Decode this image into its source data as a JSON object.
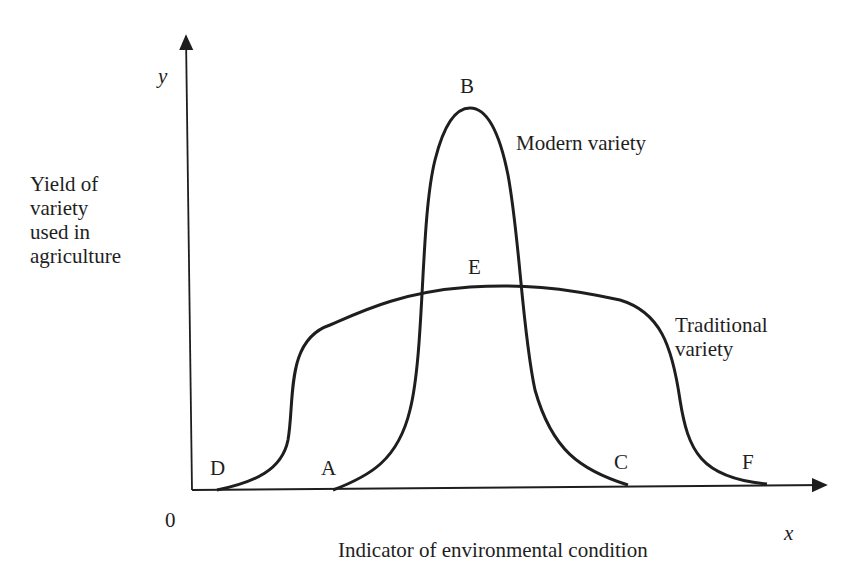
{
  "diagram": {
    "y_axis": {
      "symbol": "y",
      "label_lines": [
        "Yield of",
        "variety",
        "used in",
        "agriculture"
      ]
    },
    "x_axis": {
      "symbol": "x",
      "label": "Indicator of environmental condition"
    },
    "origin_label": "0",
    "curves": [
      {
        "name": "Modern variety",
        "label": "Modern variety",
        "points": {
          "start": "A",
          "peak": "B",
          "end": "C"
        }
      },
      {
        "name": "Traditional variety",
        "label_lines": [
          "Traditional",
          "variety"
        ],
        "points": {
          "start": "D",
          "peak": "E",
          "end": "F"
        }
      }
    ],
    "point_labels": {
      "A": "A",
      "B": "B",
      "C": "C",
      "D": "D",
      "E": "E",
      "F": "F"
    },
    "colors": {
      "line": "#1e1e1e",
      "background": "#ffffff"
    }
  }
}
